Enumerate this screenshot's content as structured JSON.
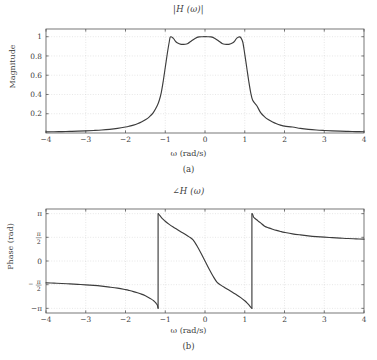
{
  "figure": {
    "panels": [
      {
        "id": "a",
        "caption": "(a)",
        "title": "|H (ω)|",
        "xlabel": "ω (rad/s)",
        "ylabel": "Magnitude"
      },
      {
        "id": "b",
        "caption": "(b)",
        "title": "∠H (ω)",
        "xlabel": "ω (rad/s)",
        "ylabel": "Phase (rad)"
      }
    ]
  },
  "chart_data": [
    {
      "type": "line",
      "title": "|H (ω)|",
      "xlabel": "ω (rad/s)",
      "ylabel": "Magnitude",
      "xlim": [
        -4,
        4
      ],
      "ylim": [
        0,
        1.08
      ],
      "grid": true,
      "xticks": [
        -4,
        -3,
        -2,
        -1,
        0,
        1,
        2,
        3,
        4
      ],
      "xticklabels": [
        "−4",
        "−3",
        "−2",
        "−1",
        "0",
        "1",
        "2",
        "3",
        "4"
      ],
      "yticks": [
        0.2,
        0.4,
        0.6,
        0.8,
        1
      ],
      "yticklabels": [
        "0.2",
        "0.4",
        "0.6",
        "0.8",
        "1"
      ],
      "line_color": "#3c3c3c",
      "description": "Equiripple (Chebyshev type-I style) lowpass magnitude response, passband |ω|<1 with ripple between 0.92 and 1.0, steep rolloff near |ω|=1.1, stopband decaying toward 0.",
      "x": [
        -4.0,
        -3.8,
        -3.6,
        -3.4,
        -3.2,
        -3.0,
        -2.8,
        -2.6,
        -2.4,
        -2.2,
        -2.0,
        -1.9,
        -1.8,
        -1.7,
        -1.6,
        -1.5,
        -1.4,
        -1.3,
        -1.2,
        -1.15,
        -1.1,
        -1.05,
        -1.0,
        -0.95,
        -0.9,
        -0.87,
        -0.8,
        -0.75,
        -0.7,
        -0.6,
        -0.5,
        -0.43,
        -0.35,
        -0.25,
        -0.15,
        -0.05,
        0.0,
        0.05,
        0.15,
        0.25,
        0.35,
        0.43,
        0.5,
        0.6,
        0.7,
        0.75,
        0.8,
        0.87,
        0.9,
        0.95,
        1.0,
        1.05,
        1.1,
        1.15,
        1.2,
        1.3,
        1.4,
        1.5,
        1.6,
        1.7,
        1.8,
        1.9,
        2.0,
        2.2,
        2.4,
        2.6,
        2.8,
        3.0,
        3.2,
        3.4,
        3.6,
        3.8,
        4.0
      ],
      "y": [
        0.012,
        0.013,
        0.015,
        0.017,
        0.019,
        0.022,
        0.026,
        0.031,
        0.038,
        0.048,
        0.062,
        0.071,
        0.082,
        0.096,
        0.114,
        0.137,
        0.168,
        0.212,
        0.285,
        0.34,
        0.42,
        0.54,
        0.68,
        0.82,
        0.945,
        0.998,
        0.985,
        0.957,
        0.937,
        0.921,
        0.922,
        0.93,
        0.953,
        0.982,
        0.998,
        1.0,
        1.0,
        1.0,
        0.998,
        0.982,
        0.953,
        0.93,
        0.922,
        0.921,
        0.937,
        0.957,
        0.985,
        0.998,
        0.99,
        0.945,
        0.82,
        0.68,
        0.54,
        0.42,
        0.34,
        0.285,
        0.212,
        0.168,
        0.137,
        0.114,
        0.096,
        0.082,
        0.071,
        0.062,
        0.048,
        0.038,
        0.031,
        0.026,
        0.022,
        0.019,
        0.017,
        0.015,
        0.013,
        0.012
      ],
      "annotations": [
        "passband ripple minimum ≈ 0.92",
        "passband peaks = 1.0 at ω ≈ 0 and ω ≈ ±0.87",
        "cutoff near |ω| ≈ 1.0"
      ]
    },
    {
      "type": "line",
      "title": "∠H (ω)",
      "xlabel": "ω (rad/s)",
      "ylabel": "Phase (rad)",
      "xlim": [
        -4,
        4
      ],
      "ylim": [
        -3.45,
        3.45
      ],
      "grid": true,
      "xticks": [
        -4,
        -3,
        -2,
        -1,
        0,
        1,
        2,
        3,
        4
      ],
      "xticklabels": [
        "−4",
        "−3",
        "−2",
        "−1",
        "0",
        "1",
        "2",
        "3",
        "4"
      ],
      "yticks": [
        3.14159,
        1.5708,
        0,
        -1.5708,
        -3.14159
      ],
      "yticklabels": [
        "π",
        "π/2",
        "0",
        "−π/2",
        "−π"
      ],
      "line_color": "#3c3c3c",
      "wrap_points": [
        -1.18,
        1.18
      ],
      "description": "Wrapped phase response with 2π discontinuities at ω ≈ ±1.18; rises from about −π/2 at ω=−4 up to −π at the jump, wraps to +π, decreases monotonically through 0 at ω=0 to −π at ω≈+1.18, wraps to +π and decays toward about +1.35 rad at ω=4.",
      "x": [
        -4.0,
        -3.8,
        -3.6,
        -3.4,
        -3.2,
        -3.0,
        -2.8,
        -2.6,
        -2.4,
        -2.2,
        -2.0,
        -1.9,
        -1.8,
        -1.7,
        -1.6,
        -1.5,
        -1.4,
        -1.35,
        -1.3,
        -1.25,
        -1.22,
        -1.2,
        -1.185,
        -1.18,
        -1.175,
        -1.15,
        -1.1,
        -1.05,
        -1.0,
        -0.9,
        -0.8,
        -0.7,
        -0.6,
        -0.5,
        -0.4,
        -0.3,
        -0.2,
        -0.1,
        0.0,
        0.1,
        0.2,
        0.3,
        0.4,
        0.5,
        0.6,
        0.7,
        0.8,
        0.9,
        1.0,
        1.05,
        1.1,
        1.15,
        1.175,
        1.18,
        1.185,
        1.2,
        1.22,
        1.25,
        1.3,
        1.35,
        1.4,
        1.5,
        1.6,
        1.7,
        1.8,
        1.9,
        2.0,
        2.2,
        2.4,
        2.6,
        2.8,
        3.0,
        3.2,
        3.4,
        3.6,
        3.8,
        4.0
      ],
      "y": [
        -1.45,
        -1.47,
        -1.49,
        -1.52,
        -1.55,
        -1.58,
        -1.62,
        -1.67,
        -1.73,
        -1.8,
        -1.9,
        -1.96,
        -2.03,
        -2.11,
        -2.2,
        -2.31,
        -2.45,
        -2.53,
        -2.62,
        -2.74,
        -2.84,
        -2.92,
        -3.08,
        -3.14159,
        3.14159,
        3.06,
        2.9,
        2.76,
        2.64,
        2.43,
        2.25,
        2.09,
        1.93,
        1.77,
        1.6,
        1.4,
        1.0,
        0.52,
        0.0,
        -0.52,
        -1.0,
        -1.4,
        -1.6,
        -1.77,
        -1.93,
        -2.09,
        -2.25,
        -2.43,
        -2.64,
        -2.76,
        -2.9,
        -3.06,
        -3.13,
        -3.14159,
        3.14159,
        3.08,
        2.92,
        2.84,
        2.74,
        2.62,
        2.53,
        2.31,
        2.2,
        2.11,
        2.03,
        1.96,
        1.9,
        1.8,
        1.73,
        1.67,
        1.62,
        1.58,
        1.55,
        1.52,
        1.49,
        1.47,
        1.45
      ],
      "annotations": [
        "phase discontinuity (wrap) at ω ≈ −1.18",
        "phase discontinuity (wrap) at ω ≈ +1.18",
        "zero phase at ω = 0"
      ]
    }
  ],
  "colors": {
    "line": "#3c3c3c",
    "axis": "#555555",
    "grid": "#cfcfcf",
    "background": "#ffffff"
  }
}
